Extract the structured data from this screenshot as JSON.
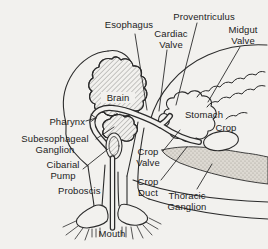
{
  "figure": {
    "type": "anatomical line diagram",
    "background_color": "#f2f1ee",
    "line_color": "#2b2b2b",
    "text_color": "#1c1c1c"
  },
  "labels": {
    "esophagus": {
      "lines": [
        "Esophagus"
      ]
    },
    "proventriculus": {
      "lines": [
        "Proventriculus"
      ]
    },
    "cardiac_valve": {
      "lines": [
        "Cardiac",
        "Valve"
      ]
    },
    "midgut_valve": {
      "lines": [
        "Midgut",
        "Valve"
      ]
    },
    "brain": {
      "lines": [
        "Brain"
      ]
    },
    "pharynx": {
      "lines": [
        "Pharynx"
      ]
    },
    "stomach": {
      "lines": [
        "Stomach"
      ]
    },
    "crop": {
      "lines": [
        "Crop"
      ]
    },
    "subesophageal_ganglion": {
      "lines": [
        "Subesophageal",
        "Ganglion"
      ]
    },
    "cibarial_pump": {
      "lines": [
        "Cibarial",
        "Pump"
      ]
    },
    "crop_valve": {
      "lines": [
        "Crop",
        "Valve"
      ]
    },
    "crop_duct": {
      "lines": [
        "Crop",
        "Duct"
      ]
    },
    "proboscis": {
      "lines": [
        "Proboscis"
      ]
    },
    "thoracic_ganglion": {
      "lines": [
        "Thoracic",
        "Ganglion"
      ]
    },
    "mouth": {
      "lines": [
        "Mouth"
      ]
    }
  }
}
